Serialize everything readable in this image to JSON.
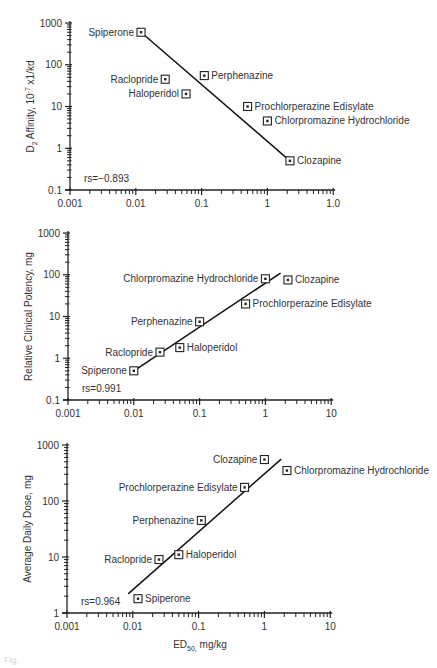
{
  "figure": {
    "xlabel_main": "ED",
    "xlabel_sub": "50,",
    "xlabel_rest": " mg/kg",
    "caption": "Fig."
  },
  "chart_data": [
    {
      "type": "scatter",
      "title": "",
      "xlabel": "",
      "ylabel": "D2 Affinity, 10-7 x1/kd",
      "ylabel_parts": {
        "pre": "D",
        "sub": "2",
        "mid": " Affinity, 10",
        "sup": "-7",
        "post": " x1/kd"
      },
      "xscale": "log",
      "yscale": "log",
      "xlim": [
        0.001,
        10
      ],
      "ylim": [
        0.1,
        1000
      ],
      "x_tick_labels": [
        "0.001",
        "0.01",
        "0.1",
        "1",
        "1.0"
      ],
      "y_tick_labels": [
        "0.1",
        "1",
        "10",
        "100",
        "1000"
      ],
      "grid": false,
      "annotation": "rs=−0.893",
      "points": [
        {
          "label": "Spiperone",
          "x": 0.012,
          "y": 600,
          "label_side": "left"
        },
        {
          "label": "Raclopride",
          "x": 0.028,
          "y": 45,
          "label_side": "left"
        },
        {
          "label": "Haloperidol",
          "x": 0.058,
          "y": 20,
          "label_side": "left"
        },
        {
          "label": "Perphenazine",
          "x": 0.11,
          "y": 55,
          "label_side": "right"
        },
        {
          "label": "Prochlorperazine Edisylate",
          "x": 0.5,
          "y": 10,
          "label_side": "right"
        },
        {
          "label": "Chlorpromazine Hydrochloride",
          "x": 1.0,
          "y": 4.5,
          "label_side": "right"
        },
        {
          "label": "Clozapine",
          "x": 2.2,
          "y": 0.5,
          "label_side": "right"
        }
      ],
      "fit_line": {
        "x1": 0.012,
        "y1": 600,
        "x2": 2.2,
        "y2": 0.5
      }
    },
    {
      "type": "scatter",
      "title": "",
      "xlabel": "",
      "ylabel": "Relative Clinical Potency, mg",
      "xscale": "log",
      "yscale": "log",
      "xlim": [
        0.001,
        10
      ],
      "ylim": [
        0.1,
        1000
      ],
      "x_tick_labels": [
        "0.001",
        "0.01",
        "0.1",
        "1",
        "10"
      ],
      "y_tick_labels": [
        "0.1",
        "1",
        "10",
        "100",
        "1000"
      ],
      "grid": false,
      "annotation": "rs=0.991",
      "points": [
        {
          "label": "Spiperone",
          "x": 0.01,
          "y": 0.5,
          "label_side": "left"
        },
        {
          "label": "Raclopride",
          "x": 0.025,
          "y": 1.4,
          "label_side": "left"
        },
        {
          "label": "Haloperidol",
          "x": 0.05,
          "y": 1.8,
          "label_side": "right"
        },
        {
          "label": "Perphenazine",
          "x": 0.1,
          "y": 7.5,
          "label_side": "left"
        },
        {
          "label": "Prochlorperazine Edisylate",
          "x": 0.5,
          "y": 20,
          "label_side": "right"
        },
        {
          "label": "Chlorpromazine Hydrochloride",
          "x": 1.0,
          "y": 80,
          "label_side": "left"
        },
        {
          "label": "Clozapine",
          "x": 2.2,
          "y": 75,
          "label_side": "right"
        }
      ],
      "fit_line": {
        "x1": 0.011,
        "y1": 0.55,
        "x2": 1.7,
        "y2": 110
      }
    },
    {
      "type": "scatter",
      "title": "",
      "xlabel": "ED50, mg/kg",
      "ylabel": "Average Daily Dose, mg",
      "xscale": "log",
      "yscale": "log",
      "xlim": [
        0.001,
        10
      ],
      "ylim": [
        1,
        1000
      ],
      "x_tick_labels": [
        "0.001",
        "0.01",
        "0.1",
        "1",
        "10"
      ],
      "y_tick_labels": [
        "1",
        "10",
        "100",
        "1000"
      ],
      "grid": false,
      "annotation": "rs=0.964",
      "points": [
        {
          "label": "Spiperone",
          "x": 0.012,
          "y": 1.8,
          "label_side": "right"
        },
        {
          "label": "Raclopride",
          "x": 0.025,
          "y": 9,
          "label_side": "left"
        },
        {
          "label": "Haloperidol",
          "x": 0.05,
          "y": 11,
          "label_side": "right"
        },
        {
          "label": "Perphenazine",
          "x": 0.11,
          "y": 45,
          "label_side": "left"
        },
        {
          "label": "Prochlorperazine Edisylate",
          "x": 0.5,
          "y": 175,
          "label_side": "left"
        },
        {
          "label": "Clozapine",
          "x": 1.0,
          "y": 550,
          "label_side": "left"
        },
        {
          "label": "Chlorpromazine Hydrochloride",
          "x": 2.2,
          "y": 350,
          "label_side": "right"
        }
      ],
      "fit_line": {
        "x1": 0.0085,
        "y1": 2.2,
        "x2": 1.8,
        "y2": 560
      }
    }
  ],
  "layout": [
    {
      "x0": 70,
      "xdec": 65.8,
      "yTop": 23,
      "yBottom": 190,
      "ymin_exp": -1,
      "ymax_exp": 3
    },
    {
      "x0": 68,
      "xdec": 65.8,
      "yTop": 233,
      "yBottom": 400,
      "ymin_exp": -1,
      "ymax_exp": 3
    },
    {
      "x0": 67,
      "xdec": 65.8,
      "yTop": 445,
      "yBottom": 613,
      "ymin_exp": 0,
      "ymax_exp": 3
    }
  ]
}
